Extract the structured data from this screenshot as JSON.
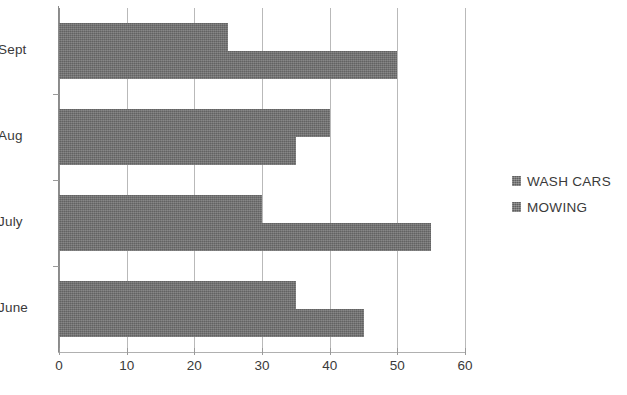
{
  "chart_data": {
    "type": "bar",
    "orientation": "horizontal",
    "title": "",
    "subtitle": "",
    "xlabel": "",
    "ylabel": "",
    "categories": [
      "Sept",
      "Aug",
      "July",
      "June"
    ],
    "series": [
      {
        "name": "WASH CARS",
        "values": [
          25,
          40,
          30,
          35
        ],
        "color": "#6e6e6e"
      },
      {
        "name": "MOWING",
        "values": [
          50,
          35,
          55,
          45
        ],
        "color": "#6e6e6e"
      }
    ],
    "xlim": [
      0,
      60
    ],
    "xticks": [
      0,
      10,
      20,
      30,
      40,
      50,
      60
    ],
    "xtick_labels": [
      "0",
      "10",
      "20",
      "30",
      "40",
      "50",
      "60"
    ],
    "grid": {
      "vertical": true,
      "horizontal": false
    },
    "legend": {
      "position": "right",
      "entries": [
        {
          "label": "WASH CARS",
          "color": "#6e6e6e"
        },
        {
          "label": "MOWING",
          "color": "#6e6e6e"
        }
      ]
    }
  },
  "colors": {
    "bar": "#6e6e6e",
    "grid": "#b9b9b9",
    "axis": "#8a8a8a",
    "text": "#3a3a3a",
    "background": "#ffffff"
  }
}
